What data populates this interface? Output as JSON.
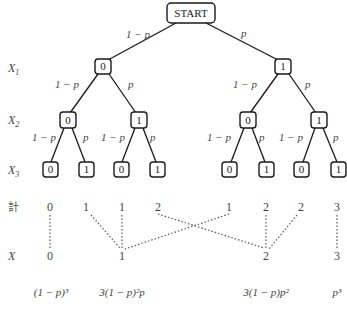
{
  "tree": {
    "root": {
      "label": "START",
      "x": 191,
      "y": 13,
      "w": 48,
      "h": 20
    },
    "levels": [
      {
        "label": "X",
        "sub": "1",
        "y": 69
      },
      {
        "label": "X",
        "sub": "2",
        "y": 121
      },
      {
        "label": "X",
        "sub": "3",
        "y": 171
      }
    ],
    "nodes": {
      "x1": [
        {
          "label": "0",
          "x": 103,
          "y": 66
        },
        {
          "label": "1",
          "x": 283,
          "y": 66
        }
      ],
      "x2": [
        {
          "label": "0",
          "x": 68,
          "y": 120
        },
        {
          "label": "1",
          "x": 139,
          "y": 120
        },
        {
          "label": "0",
          "x": 248,
          "y": 120
        },
        {
          "label": "1",
          "x": 319,
          "y": 120
        }
      ],
      "x3": [
        {
          "label": "0",
          "x": 50,
          "y": 169
        },
        {
          "label": "1",
          "x": 86,
          "y": 169
        },
        {
          "label": "0",
          "x": 121,
          "y": 169
        },
        {
          "label": "1",
          "x": 157,
          "y": 169
        },
        {
          "label": "0",
          "x": 229,
          "y": 169
        },
        {
          "label": "1",
          "x": 267,
          "y": 169
        },
        {
          "label": "0",
          "x": 302,
          "y": 169
        },
        {
          "label": "1",
          "x": 339,
          "y": 169
        }
      ]
    },
    "edge_labels": {
      "fail": "1 − p",
      "success": "p"
    }
  },
  "sum_row": {
    "label": "計",
    "values": [
      "0",
      "1",
      "1",
      "2",
      "1",
      "2",
      "2",
      "3"
    ],
    "xs": [
      50,
      86,
      122,
      158,
      229,
      266,
      301,
      337
    ]
  },
  "x_row": {
    "label": "X",
    "values": [
      "0",
      "1",
      "2",
      "3"
    ],
    "xs": [
      50,
      122,
      266,
      337
    ]
  },
  "probabilities": {
    "p0": "(1 − p)³",
    "p1": "3(1 − p)²p",
    "p2": "3(1 − p)p²",
    "p3": "p³"
  }
}
